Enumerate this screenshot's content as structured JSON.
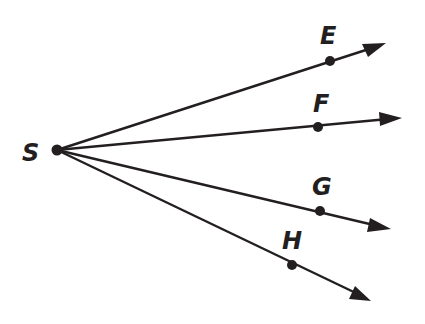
{
  "diagram": {
    "type": "rays",
    "vertex": {
      "label": "S",
      "x": 57,
      "y": 150,
      "label_x": 33,
      "label_y": 161
    },
    "rays": [
      {
        "label": "E",
        "point": [
          330,
          61
        ],
        "tip": [
          384,
          44
        ],
        "label_pos": [
          330,
          44
        ]
      },
      {
        "label": "F",
        "point": [
          318,
          127
        ],
        "tip": [
          400,
          118
        ],
        "label_pos": [
          322,
          112
        ]
      },
      {
        "label": "G",
        "point": [
          320,
          211
        ],
        "tip": [
          389,
          229
        ],
        "label_pos": [
          323,
          195
        ]
      },
      {
        "label": "H",
        "point": [
          292,
          265
        ],
        "tip": [
          370,
          300
        ],
        "label_pos": [
          291,
          249
        ]
      }
    ],
    "color": "#231f20"
  }
}
